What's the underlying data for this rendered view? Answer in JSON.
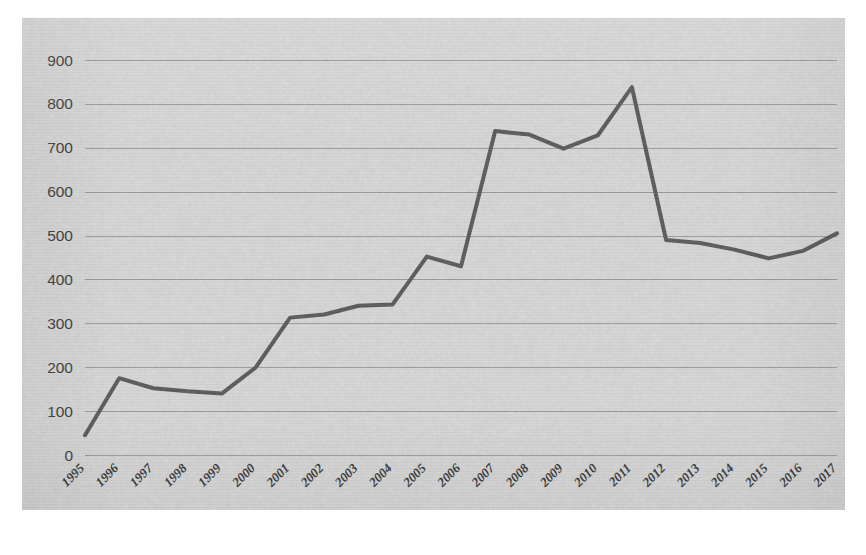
{
  "panel": {
    "background_color": "#d8d8d8",
    "plot_left": 22,
    "plot_top": 18,
    "plot_width": 823,
    "plot_height": 492
  },
  "chart_data": {
    "type": "line",
    "title": "",
    "subtitle": "",
    "xlabel": "",
    "ylabel": "",
    "categories": [
      "1995",
      "1996",
      "1997",
      "1998",
      "1999",
      "2000",
      "2001",
      "2002",
      "2003",
      "2004",
      "2005",
      "2006",
      "2007",
      "2008",
      "2009",
      "2010",
      "2011",
      "2012",
      "2013",
      "2014",
      "2015",
      "2016",
      "2017"
    ],
    "values": [
      45,
      175,
      152,
      145,
      140,
      200,
      313,
      320,
      340,
      343,
      452,
      430,
      738,
      730,
      698,
      728,
      838,
      490,
      483,
      468,
      448,
      465,
      505
    ],
    "series": [
      {
        "name": "",
        "color": "#575757",
        "line_width": 4,
        "markers": false,
        "values": [
          45,
          175,
          152,
          145,
          140,
          200,
          313,
          320,
          340,
          343,
          452,
          430,
          738,
          730,
          698,
          728,
          838,
          490,
          483,
          468,
          448,
          465,
          505
        ]
      }
    ],
    "ylim": [
      0,
      900
    ],
    "ytick_step": 100,
    "yticks": [
      0,
      100,
      200,
      300,
      400,
      500,
      600,
      700,
      800,
      900
    ],
    "ytick_labels": [
      "0",
      "100",
      "200",
      "300",
      "400",
      "500",
      "600",
      "700",
      "800",
      "900"
    ],
    "grid": {
      "horizontal": true,
      "vertical": false,
      "color": "#9b9b9b"
    },
    "xtick_rotation_deg": -45,
    "legend": {
      "visible": false,
      "position": "none",
      "entries": []
    },
    "annotations": []
  },
  "colors": {
    "panel_background": "#d8d8d8",
    "page_background": "#ffffff",
    "line": "#575757",
    "gridline": "#9b9b9b",
    "ytick_text": "#3a3a3a",
    "xtick_text": "#333333"
  }
}
